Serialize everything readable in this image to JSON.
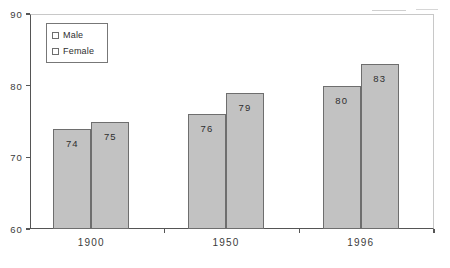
{
  "chart_data": {
    "type": "bar",
    "title": "",
    "subtitle": "",
    "xlabel": "",
    "ylabel": "",
    "categories": [
      "1900",
      "1950",
      "1996"
    ],
    "series": [
      {
        "name": "Male",
        "values": [
          74,
          76,
          80
        ],
        "color": "#c2c2c2"
      },
      {
        "name": "Female",
        "values": [
          75,
          79,
          83
        ],
        "color": "#c2c2c2"
      }
    ],
    "ylim": [
      60,
      90
    ],
    "yticks": [
      60,
      70,
      80,
      90
    ],
    "ytick_labels": [
      "60",
      "70",
      "80",
      "90"
    ],
    "grid": false,
    "legend_position": "top-left",
    "data_labels": true,
    "bar_labels": [
      {
        "text": "74"
      },
      {
        "text": "75"
      },
      {
        "text": "76"
      },
      {
        "text": "79"
      },
      {
        "text": "80"
      },
      {
        "text": "83"
      }
    ]
  },
  "axis": {
    "line_color": "#555555",
    "frame_color": "#c8c8c8"
  },
  "legend": {
    "items": [
      {
        "label": "Male"
      },
      {
        "label": "Female"
      }
    ]
  }
}
